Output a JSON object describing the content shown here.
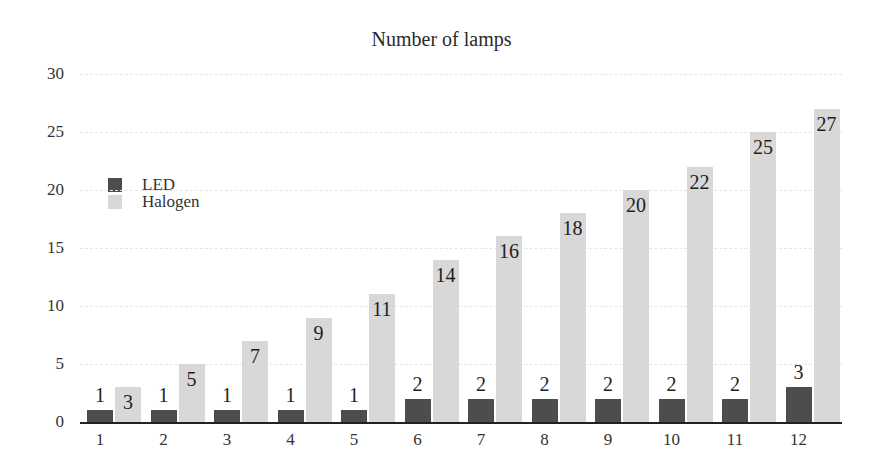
{
  "chart_data": {
    "type": "bar",
    "title": "Number of lamps",
    "xlabel": "",
    "ylabel": "",
    "categories": [
      "1",
      "2",
      "3",
      "4",
      "5",
      "6",
      "7",
      "8",
      "9",
      "10",
      "11",
      "12"
    ],
    "series": [
      {
        "name": "LED",
        "color": "#4d4d4d",
        "values": [
          1,
          1,
          1,
          1,
          1,
          2,
          2,
          2,
          2,
          2,
          2,
          3
        ]
      },
      {
        "name": "Halogen",
        "color": "#d8d8d8",
        "values": [
          3,
          5,
          7,
          9,
          11,
          14,
          16,
          18,
          20,
          22,
          25,
          27
        ]
      }
    ],
    "ylim": [
      0,
      30
    ],
    "yticks": [
      "0",
      "5",
      "10",
      "15",
      "20",
      "25",
      "30"
    ],
    "grid": true,
    "legend_position": "left"
  }
}
